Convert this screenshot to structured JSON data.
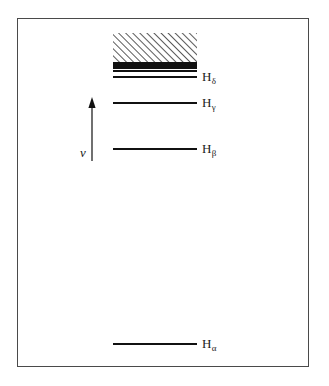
{
  "figure": {
    "type": "energy-level-spectrum-diagram",
    "background_color": "#ffffff",
    "frame": {
      "x": 17,
      "y": 18,
      "width": 292,
      "height": 349,
      "stroke_color": "#4a4a4a",
      "stroke_width": 1
    },
    "line_color": "#111111",
    "hatch_color": "#222222"
  },
  "axis": {
    "arrow": {
      "name": "frequency-axis-arrow",
      "direction": "up",
      "x": 92,
      "y_tail": 161,
      "y_head": 97,
      "color": "#111111"
    },
    "label": "ν",
    "label_meaning": "frequency"
  },
  "chart_data": {
    "type": "line",
    "title": "",
    "subtitle": "",
    "xlabel": "",
    "ylabel": "ν",
    "grid": false,
    "legend": false,
    "orientation": "horizontal-spectral-lines",
    "axis_direction": "frequency increases upward",
    "series_name": "Balmer series",
    "line_x_start": 113,
    "line_x_end": 197,
    "categories": [
      "Hα",
      "Hβ",
      "Hγ",
      "Hδ"
    ],
    "labels": [
      {
        "base": "H",
        "sub": "α",
        "y": 344,
        "label_x": 202,
        "label_y": 337
      },
      {
        "base": "H",
        "sub": "β",
        "y": 149,
        "label_x": 202,
        "label_y": 142
      },
      {
        "base": "H",
        "sub": "γ",
        "y": 103,
        "label_x": 202,
        "label_y": 96
      },
      {
        "base": "H",
        "sub": "δ",
        "y": 77,
        "label_x": 202,
        "label_y": 70
      }
    ],
    "named_lines": [
      {
        "name": "H-alpha-line",
        "y": 344,
        "thickness": 2.2
      },
      {
        "name": "H-beta-line",
        "y": 149,
        "thickness": 2.2
      },
      {
        "name": "H-gamma-line",
        "y": 103,
        "thickness": 2.0
      },
      {
        "name": "H-delta-line",
        "y": 77,
        "thickness": 2.0
      }
    ],
    "converging_lines": [
      {
        "y": 71.0,
        "thickness": 1.6
      },
      {
        "y": 68.2,
        "thickness": 1.5
      },
      {
        "y": 66.3,
        "thickness": 1.4
      },
      {
        "y": 64.9,
        "thickness": 1.3
      },
      {
        "y": 63.9,
        "thickness": 1.2
      },
      {
        "y": 63.1,
        "thickness": 1.1
      },
      {
        "y": 62.5,
        "thickness": 1.0
      }
    ],
    "series_limit_y": 62,
    "continuum_block": {
      "name": "continuum-hatched-region",
      "x": 113,
      "y": 33,
      "width": 84,
      "height": 29,
      "hatch_angle_deg": 45,
      "hatch_spacing": 5,
      "description": "ionisation continuum above series limit"
    }
  }
}
